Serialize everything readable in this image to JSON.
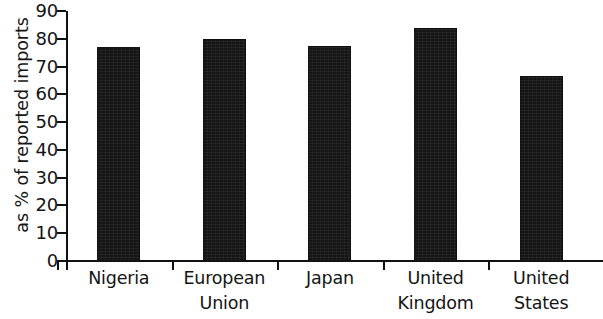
{
  "chart_data": {
    "type": "bar",
    "title": "",
    "subtitle": "",
    "xlabel": "",
    "ylabel": "as % of reported imports",
    "categories": [
      "Nigeria",
      "European Union",
      "Japan",
      "United Kingdom",
      "United States"
    ],
    "category_lines": [
      [
        "Nigeria"
      ],
      [
        "European",
        "Union"
      ],
      [
        "Japan"
      ],
      [
        "United",
        "Kingdom"
      ],
      [
        "United",
        "States"
      ]
    ],
    "values": [
      77,
      80,
      77.5,
      84,
      66.5
    ],
    "ylim": [
      0,
      90
    ],
    "y_ticks": [
      90,
      80,
      70,
      60,
      50,
      40,
      30,
      20,
      10,
      0
    ],
    "y_tick_labels": [
      "90",
      "80",
      "70",
      "60",
      "50",
      "40",
      "30",
      "20",
      "10",
      "0"
    ],
    "grid": false,
    "legend": null,
    "legend_position": "none",
    "bar_color": "#151515",
    "axis_color": "#111111",
    "background_color": "#ffffff"
  }
}
